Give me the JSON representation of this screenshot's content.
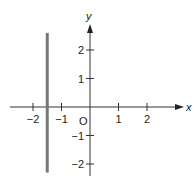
{
  "chart_data": {
    "type": "line",
    "title": "",
    "xlabel": "x",
    "ylabel": "y",
    "xlim": [
      -2.5,
      3
    ],
    "ylim": [
      -2.5,
      2.8
    ],
    "grid": false,
    "origin_label": "O",
    "x_ticks": [
      {
        "value": -2,
        "label": "−2"
      },
      {
        "value": -1,
        "label": "−1"
      },
      {
        "value": 1,
        "label": "1"
      },
      {
        "value": 2,
        "label": "2"
      }
    ],
    "y_ticks": [
      {
        "value": 2,
        "label": "2"
      },
      {
        "value": 1,
        "label": "1"
      },
      {
        "value": -1,
        "label": "−1"
      },
      {
        "value": -2,
        "label": "−2"
      }
    ],
    "series": [
      {
        "name": "x = -1.5",
        "kind": "vertical-line",
        "x": -1.5,
        "y_range": [
          -2.3,
          2.6
        ],
        "color": "#777777"
      }
    ]
  },
  "labels": {
    "x_axis": "x",
    "y_axis": "y",
    "origin": "O"
  }
}
